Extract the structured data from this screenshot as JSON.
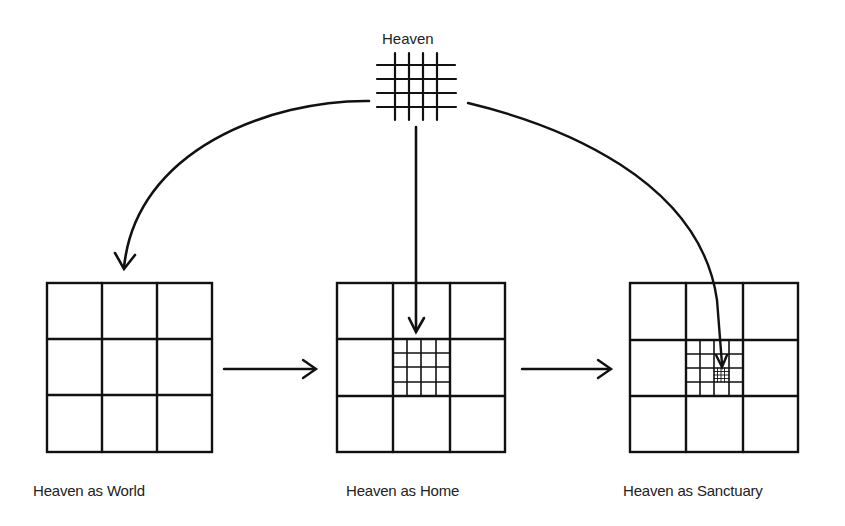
{
  "diagram": {
    "source": {
      "label": "Heaven",
      "grid_lines": 4
    },
    "stages": [
      {
        "label": "Heaven as World",
        "outer_grid": "3x3",
        "inner_grid": null,
        "innermost_grid": null
      },
      {
        "label": "Heaven as Home",
        "outer_grid": "3x3",
        "inner_grid": "4x4 in center cell",
        "innermost_grid": null
      },
      {
        "label": "Heaven as Sanctuary",
        "outer_grid": "3x3",
        "inner_grid": "4x4 in center cell",
        "innermost_grid": "small grid in inner cell (row 3, col 3)"
      }
    ],
    "arrows": [
      {
        "from": "Heaven",
        "to": "Heaven as World",
        "style": "curved"
      },
      {
        "from": "Heaven",
        "to": "Heaven as Home",
        "style": "straight-down"
      },
      {
        "from": "Heaven",
        "to": "Heaven as Sanctuary",
        "style": "curved"
      },
      {
        "from": "Heaven as World",
        "to": "Heaven as Home",
        "style": "horizontal"
      },
      {
        "from": "Heaven as Home",
        "to": "Heaven as Sanctuary",
        "style": "horizontal"
      }
    ],
    "colors": {
      "ink": "#111111",
      "background": "#ffffff"
    }
  }
}
